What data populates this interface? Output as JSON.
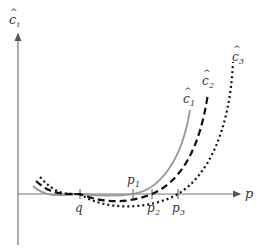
{
  "diagram": {
    "y_axis": {
      "label_base": "c",
      "label_sub": "i",
      "hat": "^"
    },
    "x_axis": {
      "label": "p"
    },
    "ticks": [
      {
        "name": "q",
        "label_base": "q",
        "label_sub": ""
      },
      {
        "name": "p1",
        "label_base": "p",
        "label_sub": "1"
      },
      {
        "name": "p2",
        "label_base": "p",
        "label_sub": "2"
      },
      {
        "name": "p3",
        "label_base": "p",
        "label_sub": "3"
      }
    ],
    "curves": [
      {
        "name": "c1",
        "label_base": "c",
        "label_sub": "1",
        "style": "solid",
        "color": "#999999"
      },
      {
        "name": "c2",
        "label_base": "c",
        "label_sub": "2",
        "style": "dashed",
        "color": "#111111"
      },
      {
        "name": "c3",
        "label_base": "c",
        "label_sub": "3",
        "style": "dotted",
        "color": "#111111"
      }
    ]
  }
}
